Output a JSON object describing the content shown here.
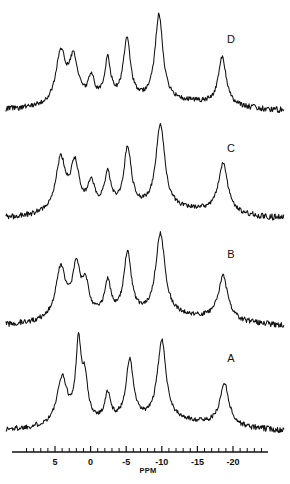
{
  "figure": {
    "type": "nmr-spectra-stack",
    "background_color": "#ffffff",
    "trace_color": "#111111",
    "trace_labels": [
      {
        "id": "A",
        "label": "A",
        "x": 231,
        "y": 362
      },
      {
        "id": "B",
        "label": "B",
        "x": 231,
        "y": 258
      },
      {
        "id": "C",
        "label": "C",
        "x": 231,
        "y": 152
      },
      {
        "id": "D",
        "label": "D",
        "x": 231,
        "y": 43
      }
    ]
  },
  "axis": {
    "title": "PPM",
    "title_x": 148,
    "title_y": 473,
    "line_y": 452,
    "line_x_start": 12,
    "line_x_end": 268,
    "tick_labels": [
      "5",
      "0",
      "-5",
      "-10",
      "-15",
      "-20"
    ],
    "tick_values": [
      5,
      0,
      -5,
      -10,
      -15,
      -20
    ],
    "minor_per_major": 5,
    "px_per_ppm": 7.12,
    "x_at_zero_ppm": 90.6,
    "label_y": 465
  },
  "chart_data": {
    "type": "line",
    "title": "",
    "subtitle": "",
    "xlabel": "PPM",
    "ylabel": "",
    "xlim": [
      8.5,
      -23.5
    ],
    "grid": false,
    "legend_position": "right-inline",
    "axis_direction": "reversed",
    "tick_labels": [
      "5",
      "0",
      "-5",
      "-10",
      "-15",
      "-20"
    ],
    "series": [
      {
        "name": "A",
        "label": "A",
        "baseline_y": 432,
        "peaks": [
          {
            "ppm": 4.0,
            "height": 46,
            "width": 2.0
          },
          {
            "ppm": 1.7,
            "height": 76,
            "width": 1.1
          },
          {
            "ppm": 0.8,
            "height": 38,
            "width": 1.1
          },
          {
            "ppm": -2.4,
            "height": 26,
            "width": 1.1
          },
          {
            "ppm": -5.5,
            "height": 60,
            "width": 1.5
          },
          {
            "ppm": -10.0,
            "height": 80,
            "width": 1.8
          },
          {
            "ppm": -18.8,
            "height": 42,
            "width": 1.8
          }
        ]
      },
      {
        "name": "B",
        "label": "B",
        "baseline_y": 327,
        "peaks": [
          {
            "ppm": 4.2,
            "height": 50,
            "width": 2.0
          },
          {
            "ppm": 2.0,
            "height": 48,
            "width": 1.6
          },
          {
            "ppm": 0.7,
            "height": 28,
            "width": 1.3
          },
          {
            "ppm": -2.4,
            "height": 32,
            "width": 1.3
          },
          {
            "ppm": -5.2,
            "height": 62,
            "width": 1.5
          },
          {
            "ppm": -9.8,
            "height": 82,
            "width": 1.9
          },
          {
            "ppm": -18.6,
            "height": 44,
            "width": 1.9
          }
        ]
      },
      {
        "name": "C",
        "label": "C",
        "baseline_y": 220,
        "peaks": [
          {
            "ppm": 4.2,
            "height": 52,
            "width": 2.0
          },
          {
            "ppm": 2.2,
            "height": 44,
            "width": 1.7
          },
          {
            "ppm": -0.1,
            "height": 25,
            "width": 1.3
          },
          {
            "ppm": -2.4,
            "height": 34,
            "width": 1.3
          },
          {
            "ppm": -5.2,
            "height": 60,
            "width": 1.5
          },
          {
            "ppm": -9.8,
            "height": 84,
            "width": 1.8
          },
          {
            "ppm": -18.6,
            "height": 50,
            "width": 1.9
          }
        ]
      },
      {
        "name": "D",
        "label": "D",
        "baseline_y": 112,
        "peaks": [
          {
            "ppm": 4.2,
            "height": 50,
            "width": 1.9
          },
          {
            "ppm": 2.4,
            "height": 42,
            "width": 1.8
          },
          {
            "ppm": -0.1,
            "height": 22,
            "width": 1.2
          },
          {
            "ppm": -2.4,
            "height": 40,
            "width": 1.2
          },
          {
            "ppm": -5.1,
            "height": 62,
            "width": 1.4
          },
          {
            "ppm": -9.6,
            "height": 86,
            "width": 1.6
          },
          {
            "ppm": -18.5,
            "height": 48,
            "width": 1.6
          }
        ]
      }
    ]
  },
  "caption": {
    "text": ""
  }
}
